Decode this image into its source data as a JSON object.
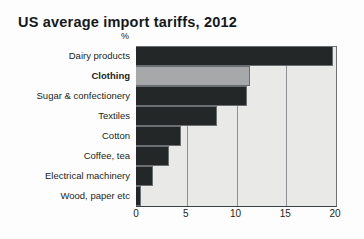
{
  "chart_data": {
    "type": "bar",
    "orientation": "horizontal",
    "title": "US average import tariffs, 2012",
    "xlabel": "%",
    "ylabel": "",
    "unit_label": "%",
    "categories": [
      "Dairy products",
      "Clothing",
      "Sugar & confectionery",
      "Textiles",
      "Cotton",
      "Coffee, tea",
      "Electrical machinery",
      "Wood, paper etc"
    ],
    "values": [
      19.8,
      11.5,
      11.2,
      8.1,
      4.5,
      3.3,
      1.7,
      0.5
    ],
    "highlight_category": "Clothing",
    "series": [
      {
        "name": "US average import tariff",
        "values": [
          19.8,
          11.5,
          11.2,
          8.1,
          4.5,
          3.3,
          1.7,
          0.5
        ]
      }
    ],
    "xlim": [
      0,
      20
    ],
    "xticks": [
      0,
      5,
      10,
      15,
      20
    ],
    "xtick_labels": [
      "0",
      "5",
      "10",
      "15",
      "20"
    ],
    "grid": true,
    "grid_axis": "x",
    "legend": false,
    "colors": {
      "bar_default": "#232728",
      "bar_highlight": "#a6a8a9",
      "plot_background": "#e9e9e7",
      "axis": "#3a3f42",
      "gridline": "#8d9194",
      "text": "#1b1f22",
      "page_background": "#fdfdfd"
    }
  }
}
